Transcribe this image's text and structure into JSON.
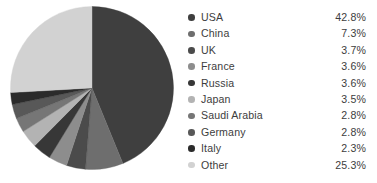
{
  "chart_data": {
    "type": "pie",
    "title": "",
    "subtitle": "",
    "xlabel": "",
    "ylabel": "",
    "grid": false,
    "legend_position": "right",
    "start_angle_deg": 0,
    "direction": "clockwise",
    "total_label": "100%",
    "categories": [
      "USA",
      "China",
      "UK",
      "France",
      "Russia",
      "Japan",
      "Saudi Arabia",
      "Germany",
      "Italy",
      "Other"
    ],
    "values": [
      42.8,
      7.3,
      3.7,
      3.6,
      3.6,
      3.5,
      2.8,
      2.8,
      2.3,
      25.3
    ],
    "value_labels": [
      "42.8%",
      "7.3%",
      "3.7%",
      "3.6%",
      "3.6%",
      "3.5%",
      "2.8%",
      "2.8%",
      "2.3%",
      "25.3%"
    ],
    "colors": [
      "#3f3f3f",
      "#6e6e6e",
      "#4b4b4b",
      "#8d8d8d",
      "#373737",
      "#b3b3b3",
      "#767676",
      "#585858",
      "#2b2b2b",
      "#d2d2d2"
    ],
    "slices": [
      {
        "label": "USA",
        "value": 42.8,
        "value_label": "42.8%",
        "color": "#3f3f3f"
      },
      {
        "label": "China",
        "value": 7.3,
        "value_label": "7.3%",
        "color": "#6e6e6e"
      },
      {
        "label": "UK",
        "value": 3.7,
        "value_label": "3.7%",
        "color": "#4b4b4b"
      },
      {
        "label": "France",
        "value": 3.6,
        "value_label": "3.6%",
        "color": "#8d8d8d"
      },
      {
        "label": "Russia",
        "value": 3.6,
        "value_label": "3.6%",
        "color": "#373737"
      },
      {
        "label": "Japan",
        "value": 3.5,
        "value_label": "3.5%",
        "color": "#b3b3b3"
      },
      {
        "label": "Saudi Arabia",
        "value": 2.8,
        "value_label": "2.8%",
        "color": "#767676"
      },
      {
        "label": "Germany",
        "value": 2.8,
        "value_label": "2.8%",
        "color": "#585858"
      },
      {
        "label": "Italy",
        "value": 2.3,
        "value_label": "2.3%",
        "color": "#2b2b2b"
      },
      {
        "label": "Other",
        "value": 25.3,
        "value_label": "25.3%",
        "color": "#d2d2d2"
      }
    ]
  },
  "legend": {
    "marker_icon": "filled-circle-icon",
    "rows": [
      {
        "label": "USA",
        "value_label": "42.8%",
        "color": "#3f3f3f"
      },
      {
        "label": "China",
        "value_label": "7.3%",
        "color": "#6e6e6e"
      },
      {
        "label": "UK",
        "value_label": "3.7%",
        "color": "#4b4b4b"
      },
      {
        "label": "France",
        "value_label": "3.6%",
        "color": "#8d8d8d"
      },
      {
        "label": "Russia",
        "value_label": "3.6%",
        "color": "#373737"
      },
      {
        "label": "Japan",
        "value_label": "3.5%",
        "color": "#b3b3b3"
      },
      {
        "label": "Saudi Arabia",
        "value_label": "2.8%",
        "color": "#767676"
      },
      {
        "label": "Germany",
        "value_label": "2.8%",
        "color": "#585858"
      },
      {
        "label": "Italy",
        "value_label": "2.3%",
        "color": "#2b2b2b"
      },
      {
        "label": "Other",
        "value_label": "25.3%",
        "color": "#d2d2d2"
      }
    ]
  },
  "canvas": {
    "background": "#ffffff",
    "text_color": "#3d3d3d"
  }
}
